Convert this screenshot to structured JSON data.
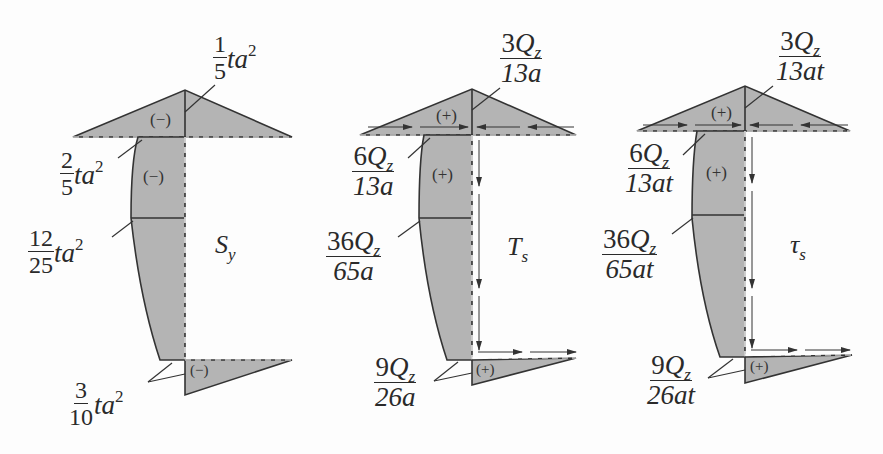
{
  "figure": {
    "fill_color": "#b4b4b4",
    "line_color": "#333333"
  },
  "diagrams": [
    {
      "title": "S",
      "title_sub": "y",
      "signs": [
        "(−)",
        "(−)",
        "(−)"
      ],
      "labels": [
        {
          "num": "1",
          "den": "5",
          "suffix": "ta",
          "exp": "2"
        },
        {
          "num": "2",
          "den": "5",
          "suffix": "ta",
          "exp": "2"
        },
        {
          "num": "12",
          "den": "25",
          "suffix": "ta",
          "exp": "2"
        },
        {
          "num": "3",
          "den": "10",
          "suffix": "ta",
          "exp": "2"
        }
      ]
    },
    {
      "title": "T",
      "title_sub": "s",
      "signs": [
        "(+)",
        "(+)",
        "(+)"
      ],
      "labels": [
        {
          "num_coef": "3",
          "num_var": "Q",
          "num_sub": "z",
          "den": "13a"
        },
        {
          "num_coef": "6",
          "num_var": "Q",
          "num_sub": "z",
          "den": "13a"
        },
        {
          "num_coef": "36",
          "num_var": "Q",
          "num_sub": "z",
          "den": "65a"
        },
        {
          "num_coef": "9",
          "num_var": "Q",
          "num_sub": "z",
          "den": "26a"
        }
      ]
    },
    {
      "title": "τ",
      "title_sub": "s",
      "signs": [
        "(+)",
        "(+)",
        "(+)"
      ],
      "labels": [
        {
          "num_coef": "3",
          "num_var": "Q",
          "num_sub": "z",
          "den": "13at"
        },
        {
          "num_coef": "6",
          "num_var": "Q",
          "num_sub": "z",
          "den": "13at"
        },
        {
          "num_coef": "36",
          "num_var": "Q",
          "num_sub": "z",
          "den": "65at"
        },
        {
          "num_coef": "9",
          "num_var": "Q",
          "num_sub": "z",
          "den": "26at"
        }
      ]
    }
  ]
}
